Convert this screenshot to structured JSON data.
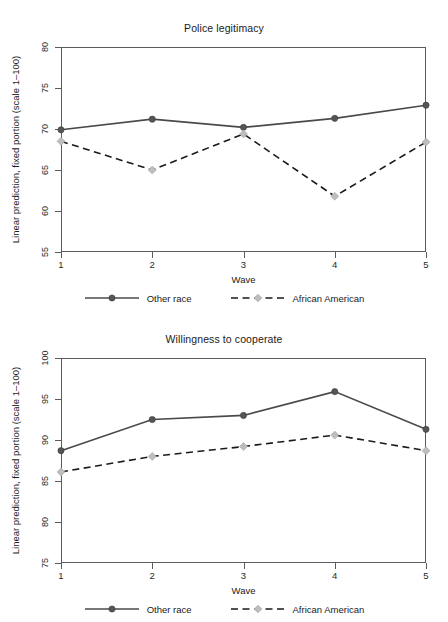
{
  "figure": {
    "width": 448,
    "height": 622,
    "background": "#ffffff"
  },
  "series_style": {
    "other_race": {
      "name": "Other race",
      "color": "#4a4a4a",
      "marker_color": "#555555",
      "line": "solid"
    },
    "african_american": {
      "name": "African American",
      "color": "#1a1a1a",
      "marker_color": "#bdbdbd",
      "line": "dashed"
    }
  },
  "panels": [
    {
      "id": "police-legitimacy",
      "title": "Police legitimacy",
      "xlabel": "Wave",
      "ylabel": "Linear prediction, fixed portion (scale 1–100)",
      "xticks": [
        "1",
        "2",
        "3",
        "4",
        "5"
      ],
      "yticks": [
        "55",
        "60",
        "65",
        "70",
        "75",
        "80"
      ],
      "legend": [
        {
          "label": "Other race"
        },
        {
          "label": "African American"
        }
      ]
    },
    {
      "id": "willingness-to-cooperate",
      "title": "Willingness to cooperate",
      "xlabel": "Wave",
      "ylabel": "Linear prediction, fixed portion (scale 1–100)",
      "xticks": [
        "1",
        "2",
        "3",
        "4",
        "5"
      ],
      "yticks": [
        "75",
        "80",
        "85",
        "90",
        "95",
        "100"
      ],
      "legend": [
        {
          "label": "Other race"
        },
        {
          "label": "African American"
        }
      ]
    }
  ],
  "chart_data": [
    {
      "type": "line",
      "title": "Police legitimacy",
      "xlabel": "Wave",
      "ylabel": "Linear prediction, fixed portion (scale 1–100)",
      "x": [
        1,
        2,
        3,
        4,
        5
      ],
      "categories": [
        "1",
        "2",
        "3",
        "4",
        "5"
      ],
      "xlim": [
        1,
        5
      ],
      "ylim": [
        55,
        80
      ],
      "yticks": [
        55,
        60,
        65,
        70,
        75,
        80
      ],
      "xticks": [
        1,
        2,
        3,
        4,
        5
      ],
      "grid": false,
      "legend_position": "below",
      "series": [
        {
          "name": "Other race",
          "values": [
            69.9,
            71.2,
            70.2,
            71.3,
            72.9
          ],
          "line": "solid",
          "marker": "circle",
          "color": "#4a4a4a"
        },
        {
          "name": "African American",
          "values": [
            68.5,
            65.0,
            69.4,
            61.8,
            68.4
          ],
          "line": "dashed",
          "marker": "diamond",
          "color": "#1a1a1a"
        }
      ]
    },
    {
      "type": "line",
      "title": "Willingness to cooperate",
      "xlabel": "Wave",
      "ylabel": "Linear prediction, fixed portion (scale 1–100)",
      "x": [
        1,
        2,
        3,
        4,
        5
      ],
      "categories": [
        "1",
        "2",
        "3",
        "4",
        "5"
      ],
      "xlim": [
        1,
        5
      ],
      "ylim": [
        75,
        100
      ],
      "yticks": [
        75,
        80,
        85,
        90,
        95,
        100
      ],
      "xticks": [
        1,
        2,
        3,
        4,
        5
      ],
      "grid": false,
      "legend_position": "below",
      "series": [
        {
          "name": "Other race",
          "values": [
            88.7,
            92.5,
            93.0,
            95.9,
            91.3
          ],
          "line": "solid",
          "marker": "circle",
          "color": "#4a4a4a"
        },
        {
          "name": "African American",
          "values": [
            86.1,
            88.0,
            89.2,
            90.6,
            88.7
          ],
          "line": "dashed",
          "marker": "diamond",
          "color": "#1a1a1a"
        }
      ]
    }
  ]
}
